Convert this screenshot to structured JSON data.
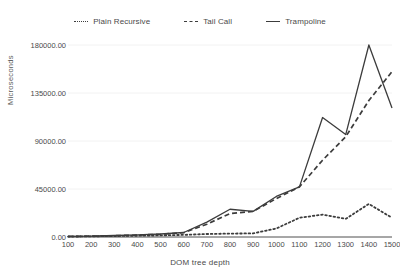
{
  "chart_data": {
    "type": "line",
    "title": "",
    "xlabel": "DOM tree depth",
    "ylabel": "Microseconds",
    "x": [
      100,
      200,
      300,
      400,
      500,
      600,
      700,
      800,
      900,
      1000,
      1100,
      1200,
      1300,
      1400,
      1500
    ],
    "xlim": [
      100,
      1500
    ],
    "ylim": [
      0,
      180000
    ],
    "yticks": [
      0,
      45000,
      90000,
      135000,
      180000
    ],
    "ytick_labels": [
      "0.00",
      "45000.00",
      "90000.00",
      "135000.00",
      "180000.00"
    ],
    "xtick_labels": [
      "100",
      "200",
      "300",
      "400",
      "500",
      "600",
      "700",
      "800",
      "900",
      "1000",
      "1100",
      "1200",
      "1300",
      "1400",
      "1500"
    ],
    "grid": true,
    "legend_position": "top",
    "series": [
      {
        "name": "Plain Recursive",
        "style": "dotted",
        "color": "#3c3c3c",
        "values": [
          400,
          600,
          900,
          1200,
          1500,
          2000,
          2800,
          3200,
          3400,
          8000,
          18000,
          21000,
          17000,
          31000,
          18000
        ]
      },
      {
        "name": "Tail Call",
        "style": "dashed",
        "color": "#3c3c3c",
        "values": [
          500,
          800,
          1200,
          1800,
          2600,
          4000,
          12000,
          22000,
          24000,
          36000,
          47000,
          72000,
          94000,
          128000,
          155000
        ]
      },
      {
        "name": "Trampoline",
        "style": "solid",
        "color": "#3c3c3c",
        "values": [
          500,
          900,
          1400,
          2000,
          2800,
          4200,
          14000,
          26000,
          24000,
          38000,
          47000,
          112000,
          96000,
          180000,
          121000
        ]
      }
    ]
  },
  "legend": {
    "items": [
      {
        "label": "Plain Recursive",
        "marker": "dotted-line-icon"
      },
      {
        "label": "Tail Call",
        "marker": "dashed-line-icon"
      },
      {
        "label": "Trampoline",
        "marker": "solid-line-icon"
      }
    ]
  },
  "axes": {
    "y_title": "Microseconds",
    "x_title": "DOM tree depth"
  },
  "colors": {
    "line": "#3c3c3c",
    "grid": "#f2f2f2",
    "axis": "#555555",
    "text": "#4a4a4a",
    "background": "#ffffff"
  }
}
